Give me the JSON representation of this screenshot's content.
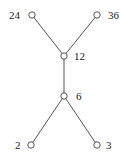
{
  "diagram": {
    "type": "hasse-diagram",
    "nodes": [
      {
        "id": "n24",
        "label": "24"
      },
      {
        "id": "n36",
        "label": "36"
      },
      {
        "id": "n12",
        "label": "12"
      },
      {
        "id": "n6",
        "label": "6"
      },
      {
        "id": "n2",
        "label": "2"
      },
      {
        "id": "n3",
        "label": "3"
      }
    ],
    "edges": [
      {
        "from": "n24",
        "to": "n12"
      },
      {
        "from": "n36",
        "to": "n12"
      },
      {
        "from": "n12",
        "to": "n6"
      },
      {
        "from": "n6",
        "to": "n2"
      },
      {
        "from": "n6",
        "to": "n3"
      }
    ],
    "colors": {
      "line": "#555555",
      "text": "#222222",
      "background": "#ffffff"
    }
  }
}
